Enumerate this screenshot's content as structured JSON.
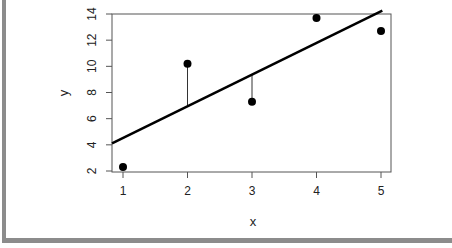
{
  "chart_data": {
    "type": "scatter",
    "title": "",
    "xlabel": "x",
    "ylabel": "y",
    "xlim": [
      0.83,
      5.15
    ],
    "ylim": [
      2,
      14
    ],
    "xticks": [
      1,
      2,
      3,
      4,
      5
    ],
    "yticks": [
      2,
      4,
      6,
      8,
      10,
      12,
      14
    ],
    "grid": false,
    "legend": null,
    "points": [
      {
        "x": 1,
        "y": 2.3
      },
      {
        "x": 2,
        "y": 10.2
      },
      {
        "x": 3,
        "y": 7.3
      },
      {
        "x": 4,
        "y": 13.7
      },
      {
        "x": 5,
        "y": 12.7
      }
    ],
    "fit_line": {
      "intercept": 2.1,
      "slope": 2.42
    },
    "residual_segments": [
      {
        "x": 2,
        "y_point": 10.2,
        "y_fit": 6.94
      },
      {
        "x": 3,
        "y_point": 7.3,
        "y_fit": 9.36
      }
    ]
  },
  "labels": {
    "xlabel": "x",
    "ylabel": "y",
    "xticks": [
      "1",
      "2",
      "3",
      "4",
      "5"
    ],
    "yticks": [
      "2",
      "4",
      "6",
      "8",
      "10",
      "12",
      "14"
    ]
  }
}
